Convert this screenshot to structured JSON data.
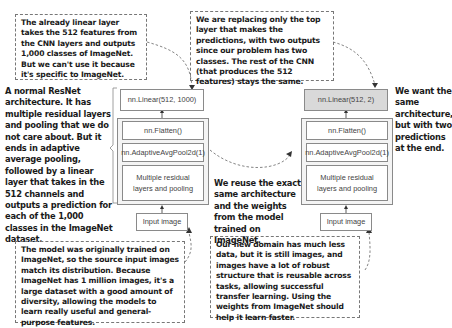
{
  "notes": {
    "top_left": "The already linear layer takes the 512 features from the CNN layers and outputs 1,000 classes of ImageNet. But we can't use it because it's specific to ImageNet.",
    "top_right": "We are replacing only the top layer that makes the predictions, with two outputs since our problem has two classes. The rest of the CNN (that produces the 512 features) stays the same.",
    "left_side": "A normal ResNet architecture. It has multiple residual layers and pooling that we do not care about. But it ends in adaptive average pooling, followed by a linear layer that takes in the 512 channels and outputs a prediction for each of the 1,000 classes in the ImageNet dataset.",
    "right_side": "We want the same architecture, but with two predictions at the end.",
    "middle": "We reuse the exact same architecture and the weights from the model trained on ImageNet.",
    "bottom_left": "The model was originally trained on ImageNet, so the source input images match its distribution. Because ImageNet has 1 million images, it's a large dataset with a good amount of diversity, allowing the models to learn really useful and general-purpose features.",
    "bottom_right": "Our new domain has much less data, but it is still images, and images have a lot of robust structure that is reusable across tasks, allowing successful transfer learning. Using the weights from ImageNet should help it learn faster."
  },
  "left_model": {
    "linear": "nn.Linear(512, 1000)",
    "flatten": "nn.Flatten()",
    "pool": "nn.AdaptiveAvgPool2d(1)",
    "residual": "Multiple residual layers and pooling",
    "input": "Input image"
  },
  "right_model": {
    "linear": "nn.Linear(512, 2)",
    "flatten": "nn.Flatten()",
    "pool": "nn.AdaptiveAvgPool2d(1)",
    "residual": "Multiple residual layers and pooling",
    "input": "Input image"
  },
  "colors": {
    "replaced_layer": "#d9d9d9",
    "border": "#8a8a8a",
    "text": "#1a1a1a"
  }
}
